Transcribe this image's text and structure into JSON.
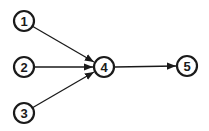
{
  "diagram": {
    "type": "directed-graph",
    "nodes": [
      {
        "id": "1",
        "label": "1",
        "x": 24,
        "y": 21
      },
      {
        "id": "2",
        "label": "2",
        "x": 24,
        "y": 67
      },
      {
        "id": "3",
        "label": "3",
        "x": 24,
        "y": 113
      },
      {
        "id": "4",
        "label": "4",
        "x": 104,
        "y": 67
      },
      {
        "id": "5",
        "label": "5",
        "x": 187,
        "y": 66
      }
    ],
    "edges": [
      {
        "from": "1",
        "to": "4"
      },
      {
        "from": "2",
        "to": "4"
      },
      {
        "from": "3",
        "to": "4"
      },
      {
        "from": "4",
        "to": "5"
      }
    ],
    "colors": {
      "stroke": "#1a1a1a",
      "background": "#ffffff"
    }
  }
}
